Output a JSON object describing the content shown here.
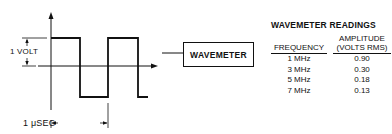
{
  "diagram": {
    "voltage_label": "1 VOLT",
    "period_label": "1 μSEC",
    "block_label": "WAVEMETER",
    "icons": [
      "y-axis-arrow-icon",
      "x-axis-arrow-icon",
      "square-wave",
      "dimension-arrows"
    ]
  },
  "readings": {
    "title": "WAVEMETER READINGS",
    "headers": {
      "frequency": "FREQUENCY",
      "amplitude_line1": "AMPLITUDE",
      "amplitude_line2": "(VOLTS RMS)"
    },
    "rows": [
      {
        "frequency": "1 MHz",
        "amplitude": "0.90"
      },
      {
        "frequency": "3 MHz",
        "amplitude": "0.30"
      },
      {
        "frequency": "5 MHz",
        "amplitude": "0.18"
      },
      {
        "frequency": "7 MHz",
        "amplitude": "0.13"
      }
    ]
  },
  "colors": {
    "ink": "#111111",
    "background": "#ffffff"
  }
}
